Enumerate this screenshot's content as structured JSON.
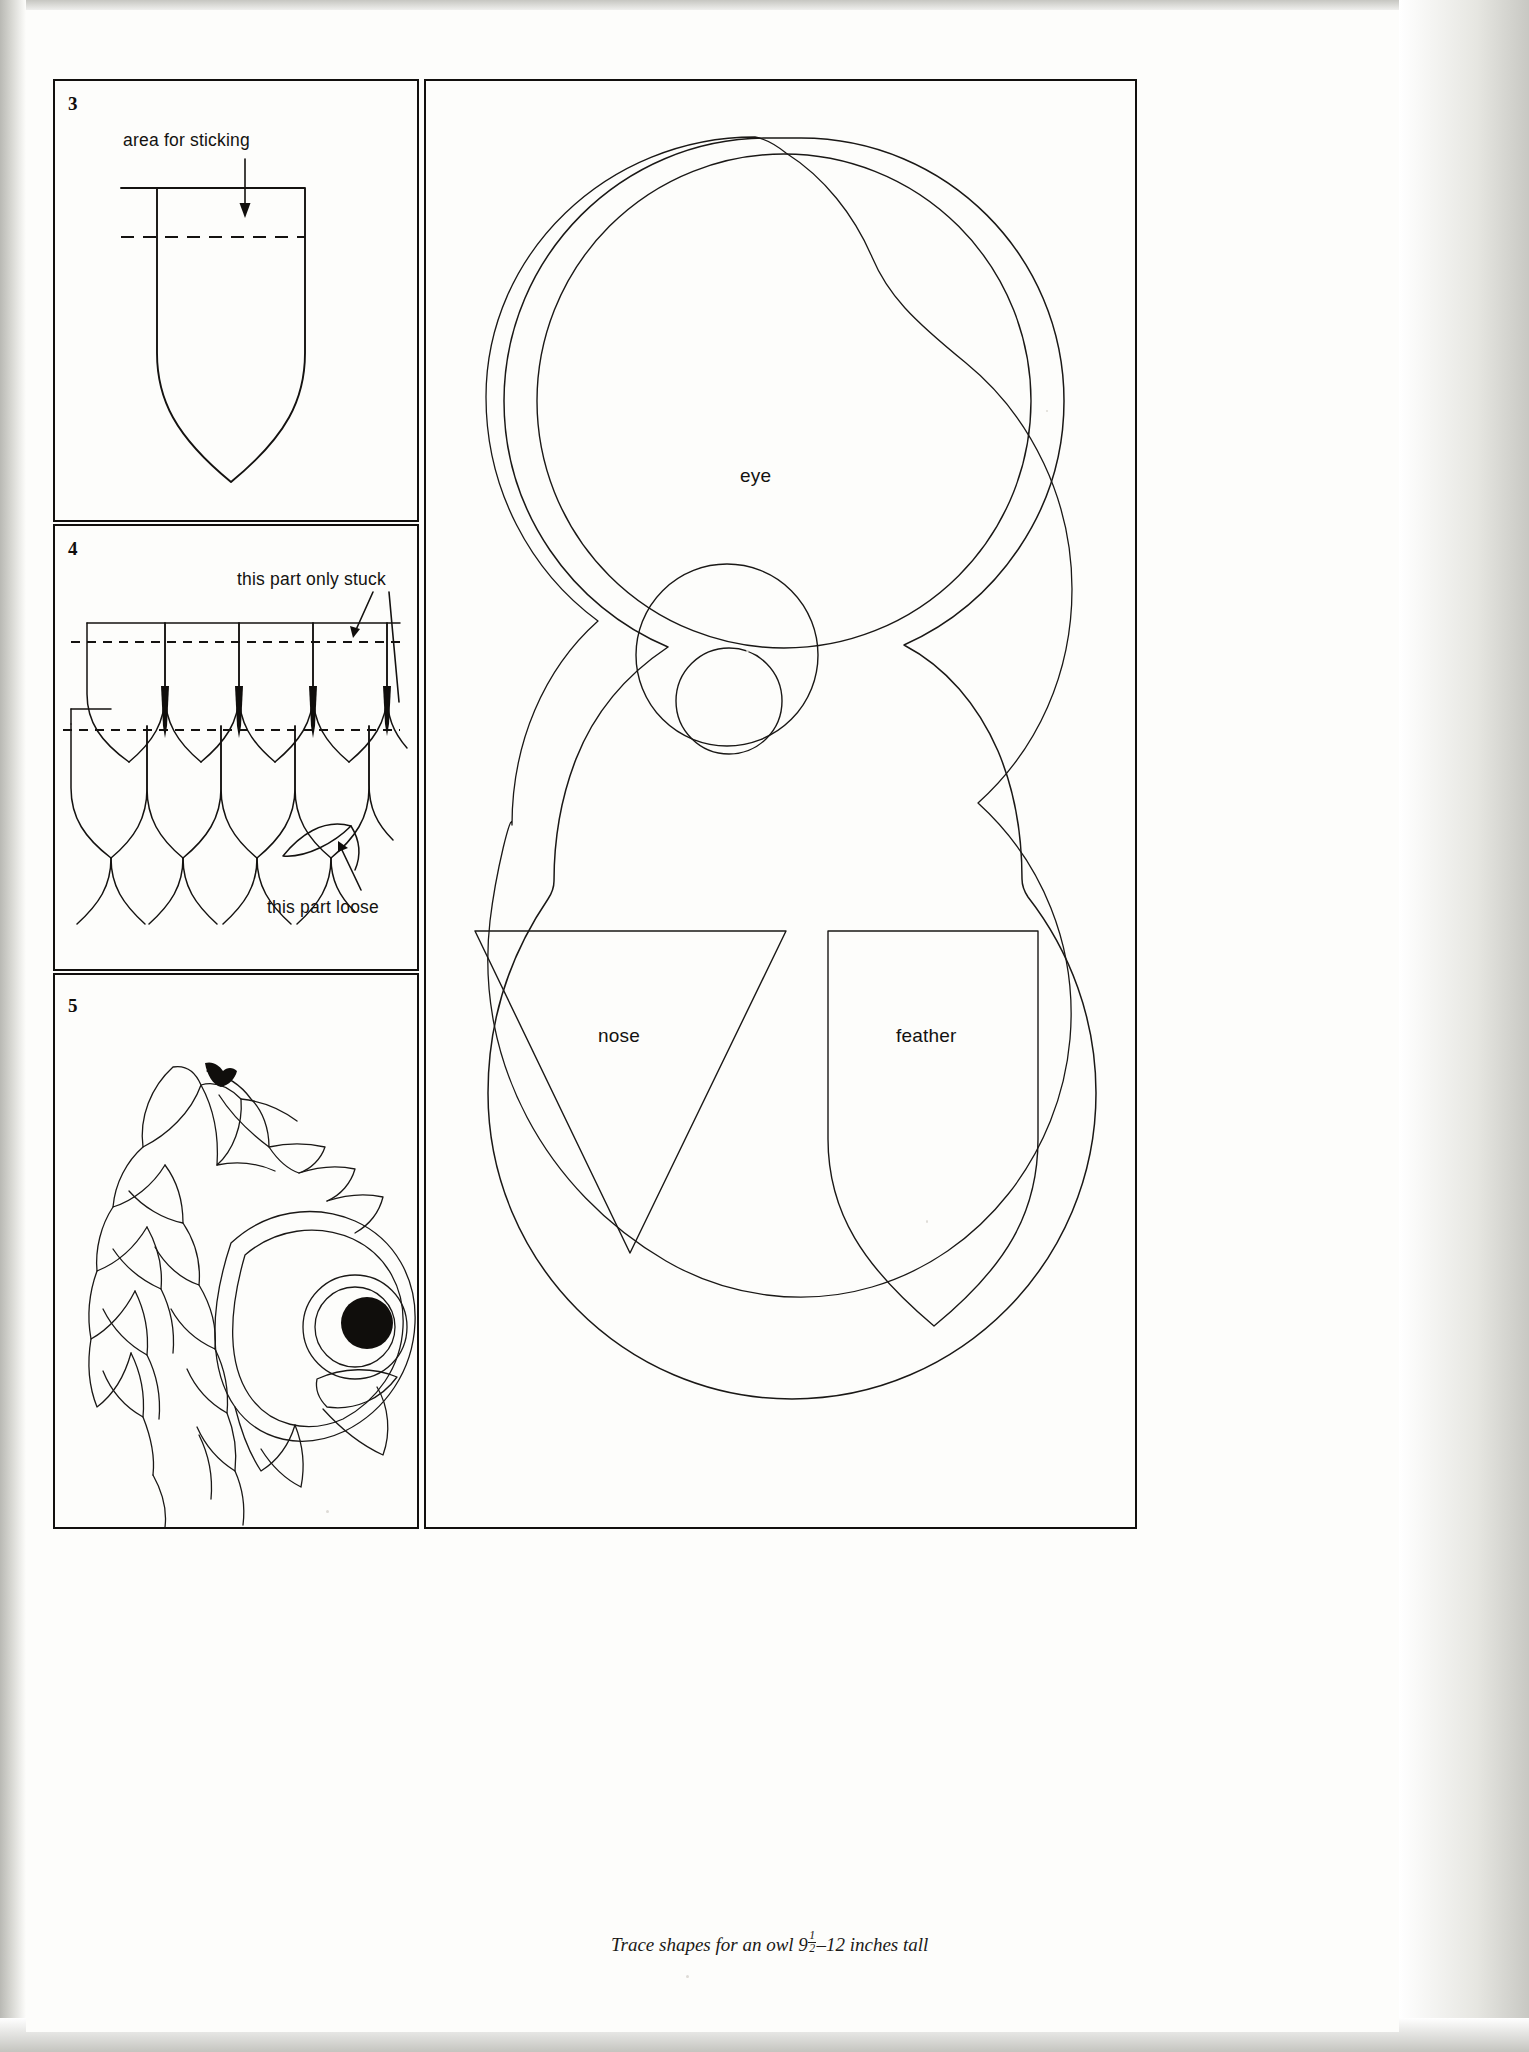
{
  "page": {
    "background_color": "#cfcfcb",
    "sheet_color": "#fdfdfb",
    "ink_color": "#141210"
  },
  "panels": [
    {
      "number": "3",
      "name": "single-feather-diagram",
      "callouts": [
        {
          "text": "area for sticking",
          "name": "area-for-sticking-label"
        }
      ]
    },
    {
      "number": "4",
      "name": "overlapping-feathers-diagram",
      "callouts": [
        {
          "text": "this part only stuck",
          "name": "this-part-only-stuck-label"
        },
        {
          "text": "this part loose",
          "name": "this-part-loose-label"
        }
      ]
    },
    {
      "number": "5",
      "name": "finished-owl-head-illustration",
      "callouts": []
    }
  ],
  "templates": {
    "name": "trace-shapes-panel",
    "shape_labels": [
      {
        "text": "eye",
        "name": "eye-shape-label"
      },
      {
        "text": "nose",
        "name": "nose-shape-label"
      },
      {
        "text": "feather",
        "name": "feather-shape-label"
      }
    ],
    "caption": {
      "prefix": "Trace shapes for an owl 9",
      "fraction_numerator": "1",
      "fraction_denominator": "2",
      "suffix": "–12 inches tall",
      "full_text": "Trace shapes for an owl 9½–12 inches tall"
    }
  }
}
